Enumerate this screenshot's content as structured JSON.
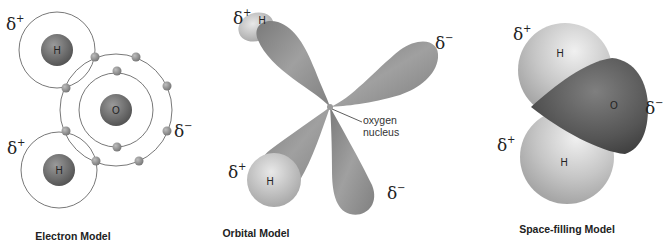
{
  "panels": [
    {
      "id": "electron",
      "caption": "Electron Model",
      "atoms": {
        "oxygen": "O",
        "hydrogen_top": "H",
        "hydrogen_bottom": "H"
      },
      "charges": {
        "h_top": "δ",
        "h_top_sign": "+",
        "h_bottom": "δ",
        "h_bottom_sign": "+",
        "oxygen": "δ",
        "oxygen_sign": "−"
      }
    },
    {
      "id": "orbital",
      "caption": "Orbital Model",
      "atoms": {
        "hydrogen_top": "H",
        "hydrogen_bottom": "H"
      },
      "annotation": {
        "line1": "oxygen",
        "line2": "nucleus"
      },
      "charges": {
        "h_top": "δ",
        "h_top_sign": "+",
        "h_bottom": "δ",
        "h_bottom_sign": "+",
        "lone_pair_1": "δ",
        "lone_pair_1_sign": "−",
        "lone_pair_2": "δ",
        "lone_pair_2_sign": "−"
      }
    },
    {
      "id": "space-filling",
      "caption": "Space-filling Model",
      "atoms": {
        "oxygen": "O",
        "hydrogen_top": "H",
        "hydrogen_bottom": "H"
      },
      "charges": {
        "h_top": "δ",
        "h_top_sign": "+",
        "h_bottom": "δ",
        "h_bottom_sign": "+",
        "oxygen": "δ",
        "oxygen_sign": "−"
      }
    }
  ],
  "colors": {
    "nucleus": "#6f6f6f",
    "electron": "#8a8a8a",
    "shell_line": "#555555",
    "lobe": "#8c8c8c",
    "hydrogen_sphere": "#c8c8c8",
    "oxygen_sphere": "#5a5a5a"
  }
}
